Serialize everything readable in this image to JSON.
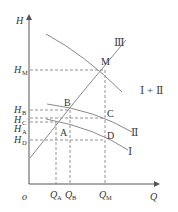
{
  "diagram": {
    "axes": {
      "y_label": "H",
      "x_label": "Q",
      "origin_label": "o"
    },
    "y_ticks": [
      {
        "main": "H",
        "sub": "M",
        "y": 72
      },
      {
        "main": "H",
        "sub": "B",
        "y": 112
      },
      {
        "main": "H",
        "sub": "C",
        "y": 121
      },
      {
        "main": "H",
        "sub": "A",
        "y": 130
      },
      {
        "main": "H",
        "sub": "D",
        "y": 141
      }
    ],
    "x_ticks": [
      {
        "main": "Q",
        "sub": "A",
        "x": 52
      },
      {
        "main": "Q",
        "sub": "B",
        "x": 66
      },
      {
        "main": "Q",
        "sub": "M",
        "x": 100
      }
    ],
    "points": [
      {
        "label": "M",
        "x": 105,
        "y": 70
      },
      {
        "label": "B",
        "x": 70,
        "y": 110
      },
      {
        "label": "C",
        "x": 105,
        "y": 118
      },
      {
        "label": "A",
        "x": 56,
        "y": 122
      },
      {
        "label": "D",
        "x": 105,
        "y": 140
      }
    ],
    "curves": [
      {
        "label": "Ⅲ",
        "name": "system-curve-III"
      },
      {
        "label": "Ⅰ + Ⅱ",
        "name": "combined-curve-I-plus-II"
      },
      {
        "label": "Ⅱ",
        "name": "pump-curve-II"
      },
      {
        "label": "Ⅰ",
        "name": "pump-curve-I"
      }
    ]
  }
}
